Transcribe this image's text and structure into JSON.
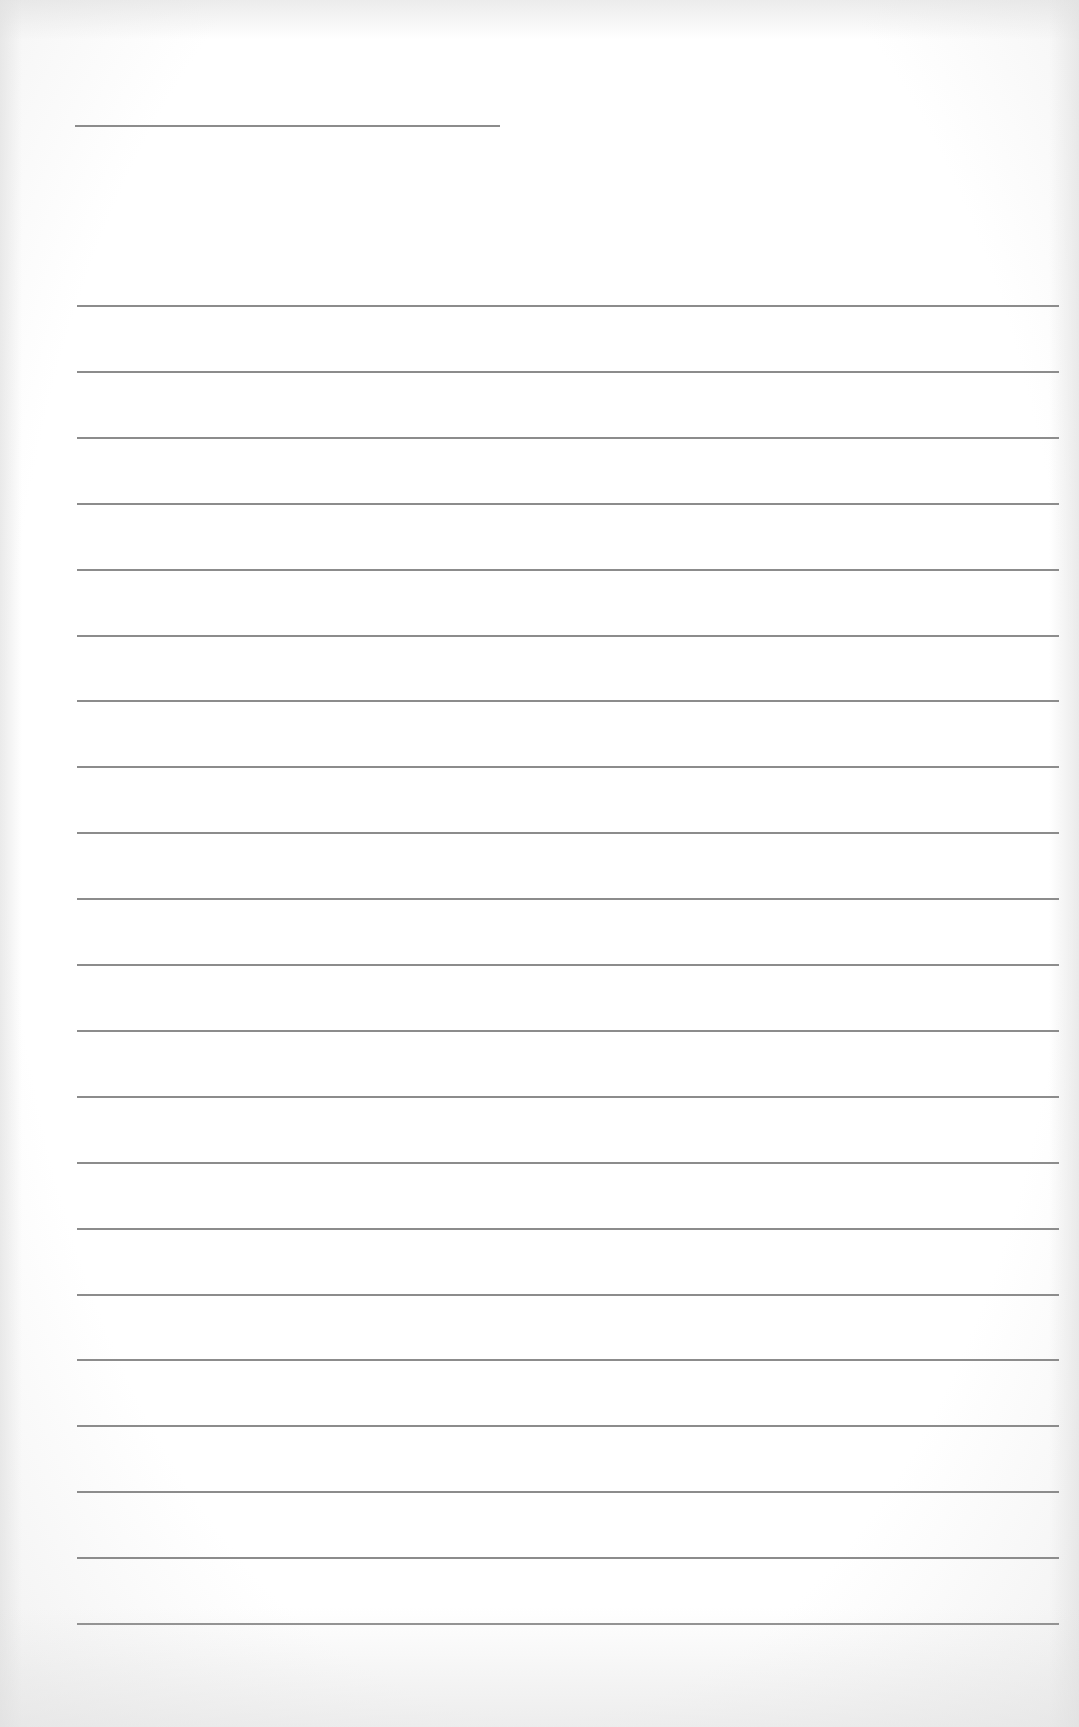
{
  "page": {
    "type": "blank lined paper",
    "background_color": "#ffffff",
    "line_color": "#8c8c8c"
  },
  "header_line": {
    "label": "",
    "left": 75,
    "top": 125,
    "width": 425
  },
  "ruled_lines": {
    "count": 21,
    "first_top": 305,
    "spacing": 65.9,
    "left": 77,
    "width": 982,
    "entries": [
      "",
      "",
      "",
      "",
      "",
      "",
      "",
      "",
      "",
      "",
      "",
      "",
      "",
      "",
      "",
      "",
      "",
      "",
      "",
      "",
      ""
    ]
  }
}
